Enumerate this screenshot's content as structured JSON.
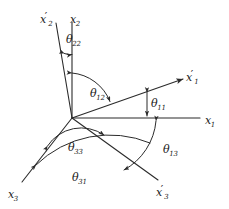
{
  "figure": {
    "background_color": "#ffffff",
    "line_color": "#2b2b2b",
    "text_color": "#1a1a1a",
    "origin": {
      "x": 72,
      "y": 118
    }
  },
  "axes": [
    {
      "id": "x2",
      "label_base": "x",
      "label_sub": "2",
      "label_prime": "",
      "label_x": 78,
      "label_y": 10,
      "description": "original vertical axis pointing up"
    },
    {
      "id": "x2p",
      "label_base": "x",
      "label_sub": "2",
      "label_prime": "′",
      "label_x": 48,
      "label_y": 10,
      "description": "primed vertical axis tilted left of x2"
    },
    {
      "id": "x1",
      "label_base": "x",
      "label_sub": "1",
      "label_prime": "",
      "label_x": 209,
      "label_y": 110,
      "description": "original horizontal axis pointing right"
    },
    {
      "id": "x1p",
      "label_base": "x",
      "label_sub": "1",
      "label_prime": "′",
      "label_x": 190,
      "label_y": 70,
      "description": "primed axis above x1, inclined upward to the right"
    },
    {
      "id": "x3",
      "label_base": "x",
      "label_sub": "3",
      "label_prime": "",
      "label_x": 12,
      "label_y": 186,
      "description": "original third axis pointing down-left"
    },
    {
      "id": "x3p",
      "label_base": "x",
      "label_sub": "3",
      "label_prime": "′",
      "label_x": 160,
      "label_y": 184,
      "description": "primed third axis pointing down-right"
    }
  ],
  "angles": [
    {
      "id": "theta22",
      "symbol": "θ",
      "sub": "22",
      "label_x": 72,
      "label_y": 36,
      "between": [
        "x2p",
        "x2"
      ],
      "description": "small angle between x2' and x2 near the top"
    },
    {
      "id": "theta12",
      "symbol": "θ",
      "sub": "12",
      "label_x": 96,
      "label_y": 91,
      "between": [
        "x2",
        "x1p"
      ],
      "description": "large angle from x2 down to x1'"
    },
    {
      "id": "theta11",
      "symbol": "θ",
      "sub": "11",
      "label_x": 152,
      "label_y": 97,
      "between": [
        "x1p",
        "x1"
      ],
      "description": "small angle between x1' and x1"
    },
    {
      "id": "theta13",
      "symbol": "θ",
      "sub": "13",
      "label_x": 168,
      "label_y": 146,
      "between": [
        "x1",
        "x3p"
      ],
      "description": "angle from x1 down to x3'"
    },
    {
      "id": "theta33",
      "symbol": "θ",
      "sub": "33",
      "label_x": 74,
      "label_y": 142,
      "between": [
        "x3",
        "x3p"
      ],
      "description": "angle between x3 and x3' near the origin"
    },
    {
      "id": "theta31",
      "symbol": "θ",
      "sub": "31",
      "label_x": 77,
      "label_y": 173,
      "between": [
        "x3",
        "x1p"
      ],
      "description": "wide lower arc from x3 to x1'"
    }
  ]
}
